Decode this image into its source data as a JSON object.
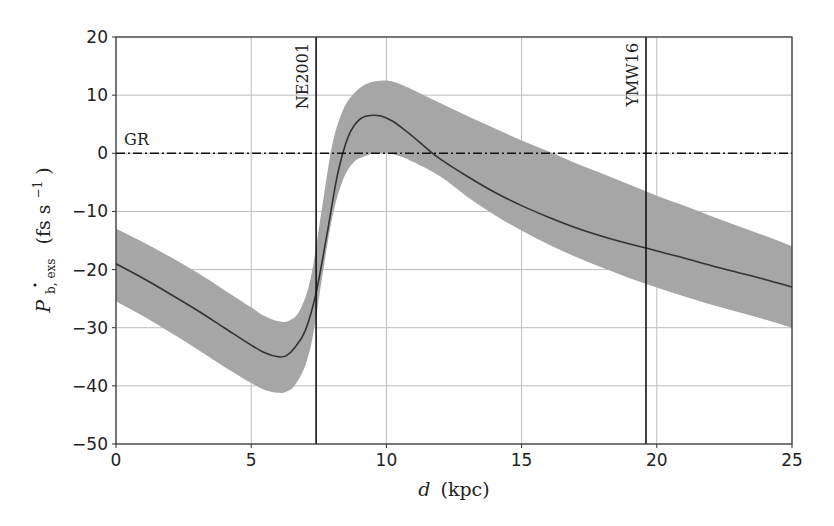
{
  "chart_data": {
    "type": "line",
    "title": "",
    "xlabel": "d (kpc)",
    "xlabel_italic": "d",
    "xlabel_unit": "(kpc)",
    "ylabel": "Ṗ_b,exs (fs s^-1)",
    "ylabel_main": "P",
    "ylabel_sub": "b, exs",
    "ylabel_unit": "(fs s",
    "ylabel_exp": "−1",
    "ylabel_close": ")",
    "xlim": [
      0,
      25
    ],
    "ylim": [
      -50,
      20
    ],
    "xticks": [
      0,
      5,
      10,
      15,
      20,
      25
    ],
    "xtick_labels": [
      "0",
      "5",
      "10",
      "15",
      "20",
      "25"
    ],
    "yticks": [
      20,
      10,
      0,
      -10,
      -20,
      -30,
      -40,
      -50
    ],
    "ytick_labels": [
      "20",
      "10",
      "0",
      "−10",
      "−20",
      "−30",
      "−40",
      "−50"
    ],
    "grid": true,
    "series": [
      {
        "name": "Ṗ_b,exs (central)",
        "style": "solid",
        "color": "#333333",
        "x": [
          0,
          1,
          2,
          3,
          4,
          5,
          5.5,
          6,
          6.3,
          6.6,
          7,
          7.4,
          7.8,
          8.2,
          8.6,
          9,
          9.4,
          9.8,
          10.2,
          10.6,
          11,
          11.5,
          12,
          13,
          14,
          15,
          16,
          17,
          18,
          19,
          19.6,
          20,
          21,
          22,
          23,
          24,
          25
        ],
        "values": [
          -19,
          -21.5,
          -24.2,
          -27,
          -30,
          -33,
          -34.3,
          -35,
          -34.8,
          -33.5,
          -30.5,
          -24,
          -14,
          -3.5,
          3,
          5.8,
          6.5,
          6.4,
          5.6,
          4.3,
          2.8,
          0.8,
          -1,
          -4,
          -6.7,
          -9,
          -11,
          -12.8,
          -14.3,
          -15.6,
          -16.3,
          -16.8,
          -18,
          -19.3,
          -20.5,
          -21.7,
          -23
        ]
      },
      {
        "name": "uncertainty band upper",
        "style": "fill",
        "color": "#a6a6a6",
        "x": [
          0,
          1,
          2,
          3,
          4,
          5,
          5.5,
          6,
          6.4,
          6.8,
          7.2,
          7.6,
          8,
          8.4,
          8.8,
          9.2,
          9.6,
          10,
          10.4,
          10.8,
          11.2,
          12,
          13,
          14,
          15,
          16,
          17,
          18,
          19,
          20,
          21,
          22,
          23,
          24,
          25
        ],
        "values": [
          -13,
          -15.3,
          -17.8,
          -20.5,
          -23.5,
          -26.5,
          -28,
          -28.9,
          -28.8,
          -27,
          -21.5,
          -10,
          1.5,
          7.5,
          10.3,
          11.8,
          12.4,
          12.5,
          12.1,
          11.3,
          10.4,
          8.6,
          6.4,
          4.3,
          2.2,
          0.3,
          -1.7,
          -3.5,
          -5.4,
          -7.3,
          -9,
          -10.8,
          -12.5,
          -14.2,
          -16
        ]
      },
      {
        "name": "uncertainty band lower",
        "style": "fill",
        "color": "#a6a6a6",
        "x": [
          0,
          1,
          2,
          3,
          4,
          5,
          5.5,
          6,
          6.3,
          6.6,
          7,
          7.3,
          7.6,
          8,
          8.4,
          8.8,
          9.2,
          9.6,
          10,
          10.5,
          11,
          12,
          13,
          14,
          15,
          16,
          17,
          18,
          19,
          20,
          21,
          22,
          23,
          24,
          25
        ],
        "values": [
          -25.5,
          -28,
          -30.8,
          -33.7,
          -36.7,
          -39.5,
          -40.7,
          -41.2,
          -41,
          -40,
          -36.5,
          -31,
          -22,
          -11,
          -4.5,
          -1.5,
          -0.5,
          0,
          0,
          -0.5,
          -1.5,
          -4,
          -7.5,
          -10.6,
          -13.3,
          -15.7,
          -17.8,
          -19.7,
          -21.5,
          -23.1,
          -24.6,
          -26,
          -27.3,
          -28.6,
          -30
        ]
      },
      {
        "name": "GR",
        "style": "dashdot",
        "color": "#111111",
        "x": [
          0,
          25
        ],
        "values": [
          0,
          0
        ]
      }
    ],
    "vertical_lines": [
      {
        "label": "NE2001",
        "x": 7.4,
        "style": "solid",
        "color": "#111111"
      },
      {
        "label": "YMW16",
        "x": 19.6,
        "style": "solid",
        "color": "#111111"
      }
    ],
    "annotations": [
      {
        "text": "GR",
        "x": 0.3,
        "y": 1.5
      },
      {
        "text": "NE2001",
        "x": 7.1,
        "y": 19,
        "rotation": -90
      },
      {
        "text": "YMW16",
        "x": 19.3,
        "y": 19,
        "rotation": -90
      }
    ],
    "legend": "none"
  }
}
